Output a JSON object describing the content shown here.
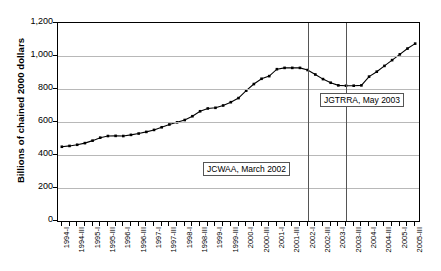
{
  "chart_data": {
    "type": "line",
    "title": "",
    "xlabel": "",
    "ylabel": "Billions of chained 2000 dollars",
    "ylim": [
      0,
      1200
    ],
    "yticks": [
      0,
      200,
      400,
      600,
      800,
      1000,
      1200
    ],
    "ytick_labels": [
      "0",
      "200",
      "400",
      "600",
      "800",
      "1,000",
      "1,200"
    ],
    "grid": true,
    "legend": "none",
    "categories": [
      "1994-I",
      "1994-II",
      "1994-III",
      "1994-IV",
      "1995-I",
      "1995-II",
      "1995-III",
      "1995-IV",
      "1996-I",
      "1996-II",
      "1996-III",
      "1996-IV",
      "1997-I",
      "1997-II",
      "1997-III",
      "1997-IV",
      "1998-I",
      "1998-II",
      "1998-III",
      "1998-IV",
      "1999-I",
      "1999-II",
      "1999-III",
      "1999-IV",
      "2000-I",
      "2000-II",
      "2000-III",
      "2000-IV",
      "2001-I",
      "2001-II",
      "2001-III",
      "2001-IV",
      "2002-I",
      "2002-II",
      "2002-III",
      "2002-IV",
      "2003-I",
      "2003-II",
      "2003-III",
      "2003-IV",
      "2004-I",
      "2004-II",
      "2004-III",
      "2004-IV",
      "2005-I",
      "2005-II",
      "2005-III"
    ],
    "xtick_labels": [
      "1994-I",
      "1994-III",
      "1995-I",
      "1995-III",
      "1996-I",
      "1996-III",
      "1997-I",
      "1997-III",
      "1998-I",
      "1998-III",
      "1999-I",
      "1999-III",
      "2000-I",
      "2000-III",
      "2001-I",
      "2001-III",
      "2002-I",
      "2002-III",
      "2003-I",
      "2003-III",
      "2004-I",
      "2004-III",
      "2005-I",
      "2005-III"
    ],
    "values": [
      450,
      455,
      462,
      472,
      487,
      505,
      515,
      516,
      515,
      522,
      530,
      540,
      552,
      568,
      585,
      598,
      612,
      635,
      665,
      682,
      686,
      700,
      720,
      745,
      790,
      830,
      862,
      878,
      920,
      928,
      928,
      928,
      915,
      888,
      860,
      838,
      822,
      820,
      820,
      822,
      818,
      820,
      830,
      848,
      872,
      900,
      920
    ],
    "annotations": [
      {
        "label": "JCWAA, March 2002",
        "at": "2002-I"
      },
      {
        "label": "JGTRRA, May 2003",
        "at": "2003-II"
      }
    ]
  },
  "series_tail": {
    "note": "final segment rises to 1,075"
  }
}
